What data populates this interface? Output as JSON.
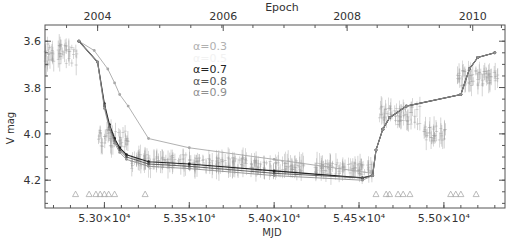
{
  "chart_data": {
    "type": "line",
    "title": "",
    "xlabel": "MJD",
    "ylabel": "V mag",
    "top_xlabel": "Epoch",
    "xlim": [
      52650,
      55360
    ],
    "ylim": [
      3.53,
      4.32
    ],
    "y_inverted": true,
    "x_ticks": [
      {
        "value": 53000,
        "label": "5.30×10⁴"
      },
      {
        "value": 53500,
        "label": "5.35×10⁴"
      },
      {
        "value": 54000,
        "label": "5.40×10⁴"
      },
      {
        "value": 54500,
        "label": "5.45×10⁴"
      },
      {
        "value": 55000,
        "label": "5.50×10⁴"
      }
    ],
    "y_ticks": [
      {
        "value": 3.6,
        "label": "3.6"
      },
      {
        "value": 3.8,
        "label": "3.8"
      },
      {
        "value": 4.0,
        "label": "4.0"
      },
      {
        "value": 4.2,
        "label": "4.2"
      }
    ],
    "top_ticks": [
      {
        "value": 52960,
        "label": "2004"
      },
      {
        "value": 53700,
        "label": "2006"
      },
      {
        "value": 54430,
        "label": "2008"
      },
      {
        "value": 55170,
        "label": "2010"
      }
    ],
    "legend": {
      "position": "upper-center",
      "entries": [
        {
          "label": "α=0.3",
          "color": "#b0b0b0"
        },
        {
          "label": "α=0.5",
          "color": "#f2f2f2"
        },
        {
          "label": "α=0.7",
          "color": "#222222"
        },
        {
          "label": "α=0.8",
          "color": "#555555"
        },
        {
          "label": "α=0.9",
          "color": "#909090"
        }
      ]
    },
    "series": [
      {
        "name": "α=0.3",
        "color": "#a8a8a8",
        "x": [
          52850,
          52940,
          53020,
          53060,
          53090,
          53140,
          53260,
          53500,
          54000,
          54580,
          54600,
          54640,
          54680,
          54780,
          55100,
          55150,
          55200,
          55300
        ],
        "y": [
          3.6,
          3.64,
          3.72,
          3.78,
          3.83,
          3.88,
          4.02,
          4.06,
          4.11,
          4.17,
          4.07,
          3.98,
          3.93,
          3.88,
          3.83,
          3.72,
          3.67,
          3.65
        ]
      },
      {
        "name": "α=0.7",
        "color": "#222222",
        "x": [
          52850,
          52960,
          53000,
          53030,
          53060,
          53090,
          53130,
          53260,
          53500,
          54000,
          54520,
          54580,
          54600,
          54640,
          54680,
          54780,
          55100,
          55150,
          55200,
          55300
        ],
        "y": [
          3.6,
          3.69,
          3.87,
          3.96,
          4.02,
          4.06,
          4.09,
          4.12,
          4.13,
          4.16,
          4.19,
          4.18,
          4.07,
          3.98,
          3.93,
          3.88,
          3.83,
          3.72,
          3.67,
          3.65
        ]
      },
      {
        "name": "α=0.8",
        "color": "#555555",
        "x": [
          52850,
          52960,
          53000,
          53030,
          53060,
          53090,
          53130,
          53260,
          53500,
          54000,
          54520,
          54580,
          54600,
          54640,
          54680,
          54780,
          55100,
          55150,
          55200,
          55300
        ],
        "y": [
          3.6,
          3.69,
          3.88,
          3.97,
          4.03,
          4.07,
          4.1,
          4.13,
          4.14,
          4.17,
          4.19,
          4.18,
          4.07,
          3.98,
          3.93,
          3.88,
          3.83,
          3.72,
          3.67,
          3.65
        ]
      },
      {
        "name": "α=0.9",
        "color": "#909090",
        "x": [
          52850,
          52960,
          53000,
          53030,
          53060,
          53090,
          53130,
          53260,
          53500,
          54000,
          54520,
          54580,
          54600,
          54640,
          54680,
          54780,
          55100,
          55150,
          55200,
          55300
        ],
        "y": [
          3.6,
          3.69,
          3.89,
          3.98,
          4.04,
          4.08,
          4.11,
          4.14,
          4.15,
          4.18,
          4.2,
          4.18,
          4.07,
          3.98,
          3.93,
          3.88,
          3.83,
          3.72,
          3.67,
          3.65
        ]
      }
    ],
    "observation_clusters": [
      {
        "x_range": [
          52650,
          52840
        ],
        "y_center": 3.66,
        "spread": 0.1
      },
      {
        "x_range": [
          52960,
          53140
        ],
        "y_center": 4.02,
        "spread": 0.08
      },
      {
        "x_range": [
          53160,
          53480
        ],
        "y_center": 4.12,
        "spread": 0.06
      },
      {
        "x_range": [
          53500,
          53840
        ],
        "y_center": 4.13,
        "spread": 0.06
      },
      {
        "x_range": [
          53860,
          54180
        ],
        "y_center": 4.14,
        "spread": 0.05
      },
      {
        "x_range": [
          54240,
          54580
        ],
        "y_center": 4.15,
        "spread": 0.05
      },
      {
        "x_range": [
          54620,
          54860
        ],
        "y_center": 3.92,
        "spread": 0.08
      },
      {
        "x_range": [
          54880,
          55010
        ],
        "y_center": 4.0,
        "spread": 0.07
      },
      {
        "x_range": [
          55080,
          55320
        ],
        "y_center": 3.76,
        "spread": 0.07
      }
    ],
    "upper_limits_triangles": {
      "y": 4.26,
      "x": [
        52830,
        52910,
        52950,
        52975,
        53000,
        53025,
        53060,
        53240,
        54600,
        54660,
        54680,
        54730,
        54760,
        54800,
        55040,
        55070,
        55100,
        55190
      ]
    }
  }
}
